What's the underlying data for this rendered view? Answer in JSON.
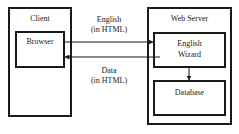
{
  "diagram": {
    "nodes": {
      "client": {
        "label": "Client"
      },
      "browser": {
        "label": "Browser"
      },
      "web_server": {
        "label": "Web Server"
      },
      "english_wizard": {
        "line1": "English",
        "line2": "Wizard"
      },
      "database": {
        "label": "Database"
      }
    },
    "edges": {
      "request": {
        "line1": "English",
        "line2": "(in HTML)",
        "from": "Browser",
        "to": "English Wizard"
      },
      "response": {
        "line1": "Data",
        "line2": "(in HTML)",
        "from": "English Wizard",
        "to": "Browser"
      },
      "wizard_to_db": {
        "from": "English Wizard",
        "to": "Database"
      }
    },
    "colors": {
      "stroke": "#1a1a1a",
      "background": "#ffffff"
    }
  }
}
